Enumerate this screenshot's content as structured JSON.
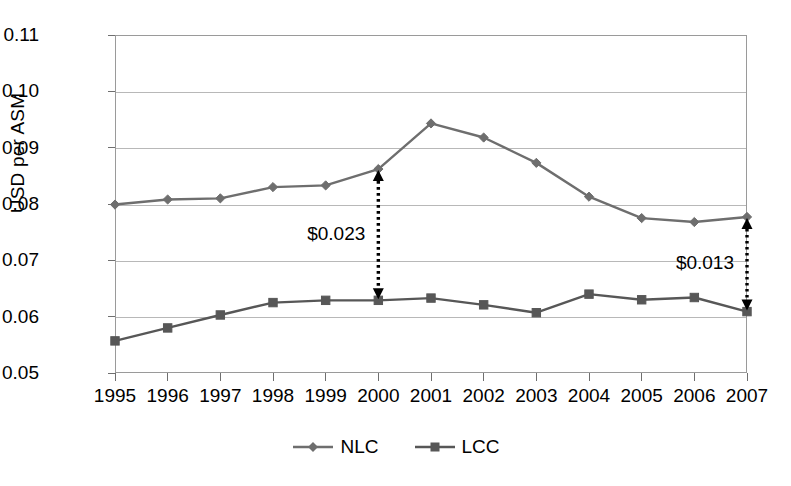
{
  "chart_data": {
    "type": "line",
    "title": "",
    "xlabel": "",
    "ylabel": "USD per ASM",
    "categories": [
      "1995",
      "1996",
      "1997",
      "1998",
      "1999",
      "2000",
      "2001",
      "2002",
      "2003",
      "2004",
      "2005",
      "2006",
      "2007"
    ],
    "series": [
      {
        "name": "NLC",
        "marker": "diamond",
        "color": "#6e6e6e",
        "values": [
          0.0799,
          0.0808,
          0.081,
          0.083,
          0.0833,
          0.0862,
          0.0943,
          0.0918,
          0.0873,
          0.0813,
          0.0775,
          0.0768,
          0.0777
        ]
      },
      {
        "name": "LCC",
        "marker": "square",
        "color": "#575757",
        "values": [
          0.0557,
          0.058,
          0.0603,
          0.0625,
          0.0629,
          0.0629,
          0.0633,
          0.0621,
          0.0607,
          0.064,
          0.063,
          0.0634,
          0.0609
        ]
      }
    ],
    "ylim": [
      0.05,
      0.11
    ],
    "ytick_labels": [
      "0.11",
      "0.10",
      "0.09",
      "0.08",
      "0.07",
      "0.06",
      "0.05"
    ],
    "ytick_values": [
      0.11,
      0.1,
      0.09,
      0.08,
      0.07,
      0.06,
      0.05
    ],
    "grid": true,
    "legend_position": "bottom",
    "annotations": [
      {
        "label": "$0.023",
        "at_category": "2000",
        "from_series": "NLC",
        "to_series": "LCC",
        "style": "dotted-double-arrow",
        "label_side": "left"
      },
      {
        "label": "$0.013",
        "at_category": "2007",
        "from_series": "NLC",
        "to_series": "LCC",
        "style": "dotted-double-arrow",
        "label_side": "left"
      }
    ]
  },
  "legend": {
    "entries": [
      {
        "label": "NLC"
      },
      {
        "label": "LCC"
      }
    ]
  }
}
